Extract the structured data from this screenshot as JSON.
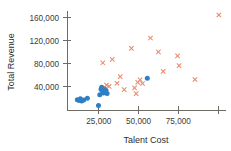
{
  "chart_data": {
    "type": "scatter",
    "title": "",
    "xlabel": "Talent Cost",
    "ylabel": "Total Revenue",
    "xlim": [
      5000,
      105000
    ],
    "ylim": [
      0,
      172000
    ],
    "xticks": [
      25000,
      50000,
      75000,
      100000
    ],
    "xticklabels": [
      "25,000",
      "50,000",
      "75,000",
      ""
    ],
    "yticks": [
      40000,
      80000,
      120000,
      160000
    ],
    "yticklabels": [
      "40,000",
      "80,000",
      "120,000",
      "160,000"
    ],
    "grid": false,
    "legend": "none",
    "series": [
      {
        "name": "blue-series",
        "color": "#2f7fc4",
        "marker": "circle",
        "points": [
          {
            "x": 11500,
            "y": 18000
          },
          {
            "x": 12600,
            "y": 16500
          },
          {
            "x": 13400,
            "y": 19500
          },
          {
            "x": 14200,
            "y": 15500
          },
          {
            "x": 15500,
            "y": 17500
          },
          {
            "x": 17800,
            "y": 20500
          },
          {
            "x": 24800,
            "y": 8000
          },
          {
            "x": 25600,
            "y": 26500
          },
          {
            "x": 26400,
            "y": 36000
          },
          {
            "x": 26800,
            "y": 39500
          },
          {
            "x": 27300,
            "y": 33000
          },
          {
            "x": 27800,
            "y": 29500
          },
          {
            "x": 28400,
            "y": 37500
          },
          {
            "x": 28900,
            "y": 31500
          },
          {
            "x": 29500,
            "y": 34500
          },
          {
            "x": 30200,
            "y": 28500
          },
          {
            "x": 55500,
            "y": 55000
          }
        ]
      },
      {
        "name": "orange-series",
        "color": "#e98a6a",
        "marker": "x",
        "points": [
          {
            "x": 27500,
            "y": 82000
          },
          {
            "x": 29800,
            "y": 43500
          },
          {
            "x": 31500,
            "y": 41000
          },
          {
            "x": 33500,
            "y": 88000
          },
          {
            "x": 36500,
            "y": 46500
          },
          {
            "x": 38500,
            "y": 58000
          },
          {
            "x": 41000,
            "y": 35500
          },
          {
            "x": 45500,
            "y": 107000
          },
          {
            "x": 47500,
            "y": 38500
          },
          {
            "x": 48500,
            "y": 28500
          },
          {
            "x": 49500,
            "y": 48000
          },
          {
            "x": 51000,
            "y": 52500
          },
          {
            "x": 52500,
            "y": 46000
          },
          {
            "x": 57500,
            "y": 125000
          },
          {
            "x": 62500,
            "y": 101000
          },
          {
            "x": 65500,
            "y": 67000
          },
          {
            "x": 74500,
            "y": 94000
          },
          {
            "x": 75500,
            "y": 77000
          },
          {
            "x": 85500,
            "y": 53000
          },
          {
            "x": 100500,
            "y": 165000
          }
        ]
      }
    ]
  }
}
